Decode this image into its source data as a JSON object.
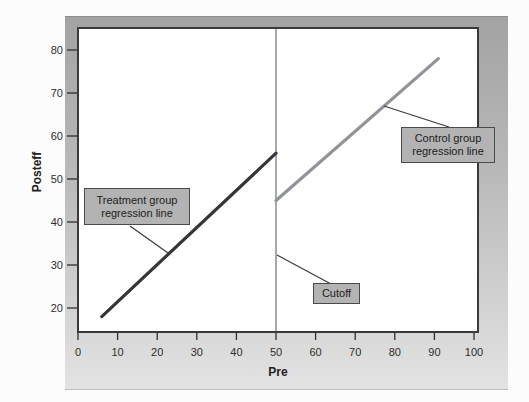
{
  "figure": {
    "x_axis_label": "Pre",
    "y_axis_label": "Posteff"
  },
  "annotations": {
    "treatment_label": "Treatment group regression line",
    "control_label": "Control group regression line",
    "cutoff_label": "Cutoff"
  },
  "colors": {
    "treatment_line": "#33353b",
    "control_line": "#90949a",
    "cutoff_line": "#90949a",
    "plot_border": "#3a3a3a",
    "tick_color": "#2d2d2d",
    "callout_line": "#3a3a3a",
    "label_box_fill": "#b3b3b3",
    "label_box_border": "#4a4a4a",
    "frame_gradient_top": "#a3a3a3",
    "frame_gradient_bottom": "#e3e3e3",
    "plot_background": "#ffffff"
  },
  "chart_data": {
    "type": "line",
    "title": "",
    "xlabel": "Pre",
    "ylabel": "Posteff",
    "xlim": [
      0,
      101
    ],
    "ylim": [
      14,
      85
    ],
    "x_ticks": [
      0,
      10,
      20,
      30,
      40,
      50,
      60,
      70,
      80,
      90,
      100
    ],
    "y_ticks": [
      20,
      30,
      40,
      50,
      60,
      70,
      80
    ],
    "grid": false,
    "legend": "callout-labels",
    "cutoff_x": 50,
    "series": [
      {
        "name": "Treatment group regression line",
        "x": [
          6,
          50
        ],
        "y": [
          18,
          56
        ],
        "color": "#33353b"
      },
      {
        "name": "Control group regression line",
        "x": [
          50,
          91
        ],
        "y": [
          45,
          78
        ],
        "color": "#90949a"
      }
    ]
  }
}
